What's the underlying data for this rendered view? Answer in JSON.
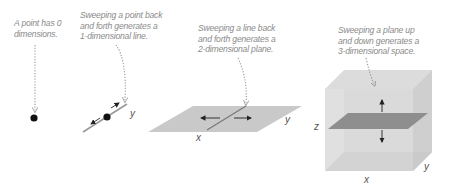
{
  "panels": [
    {
      "id": "point",
      "caption": [
        "A point has 0",
        "dimensions."
      ],
      "dimensions": 0
    },
    {
      "id": "line",
      "caption": [
        "Sweeping a point back",
        "and forth generates a",
        "1-dimensional line."
      ],
      "dimensions": 1,
      "axes": {
        "y": "y"
      }
    },
    {
      "id": "plane",
      "caption": [
        "Sweeping a line back",
        "and forth generates a",
        "2-dimensional plane."
      ],
      "dimensions": 2,
      "axes": {
        "x": "x",
        "y": "y"
      }
    },
    {
      "id": "space",
      "caption": [
        "Sweeping a plane up",
        "and down generates a",
        "3-dimensional space."
      ],
      "dimensions": 3,
      "axes": {
        "x": "x",
        "y": "y",
        "z": "z"
      }
    }
  ],
  "colors": {
    "caption": "#8a8a8a",
    "plane_fill": "#c8c8c8",
    "cube_face": "#d9d9d9",
    "inner_plane": "#8c8c8c",
    "ink": "#222222"
  }
}
